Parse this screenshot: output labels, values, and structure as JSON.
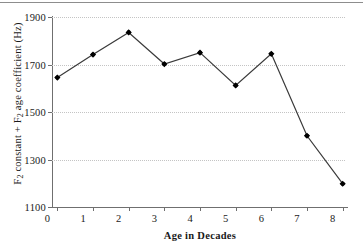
{
  "chart_data": {
    "type": "line",
    "title": "",
    "xlabel": "Age in Decades",
    "ylabel": "F2 constant + F2 age coefficient (Hz)",
    "ylabel_parts": {
      "prefix": "F",
      "sub1": "2",
      "mid": " constant + F",
      "sub2": "2",
      "suffix": " age coefficient (Hz)"
    },
    "x": [
      0,
      1,
      2,
      3,
      4,
      5,
      6,
      7,
      8
    ],
    "values": [
      1645,
      1742,
      1835,
      1702,
      1750,
      1612,
      1745,
      1400,
      1198
    ],
    "categories": [
      "0",
      "1",
      "2",
      "3",
      "4",
      "5",
      "6",
      "7",
      "8"
    ],
    "xtick_labels": [
      "0",
      "1",
      "2",
      "3",
      "4",
      "5",
      "6",
      "7",
      "8"
    ],
    "ytick_labels": [
      "1900",
      "1700",
      "1500",
      "1300",
      "1100"
    ],
    "ytick_values": [
      1900,
      1700,
      1500,
      1300,
      1100
    ],
    "xlim": [
      -0.15,
      8.15
    ],
    "ylim": [
      1100,
      1900
    ],
    "grid": true,
    "grid_axis": "y",
    "legend": null,
    "marker": "diamond",
    "marker_color": "#000000",
    "line_color": "#3a3a3a"
  },
  "figure": {
    "background_color": "#ffffff",
    "axis_color": "#6f6f6f",
    "gridline_color": "#c4c4c4",
    "text_color": "#1a1a1a"
  }
}
